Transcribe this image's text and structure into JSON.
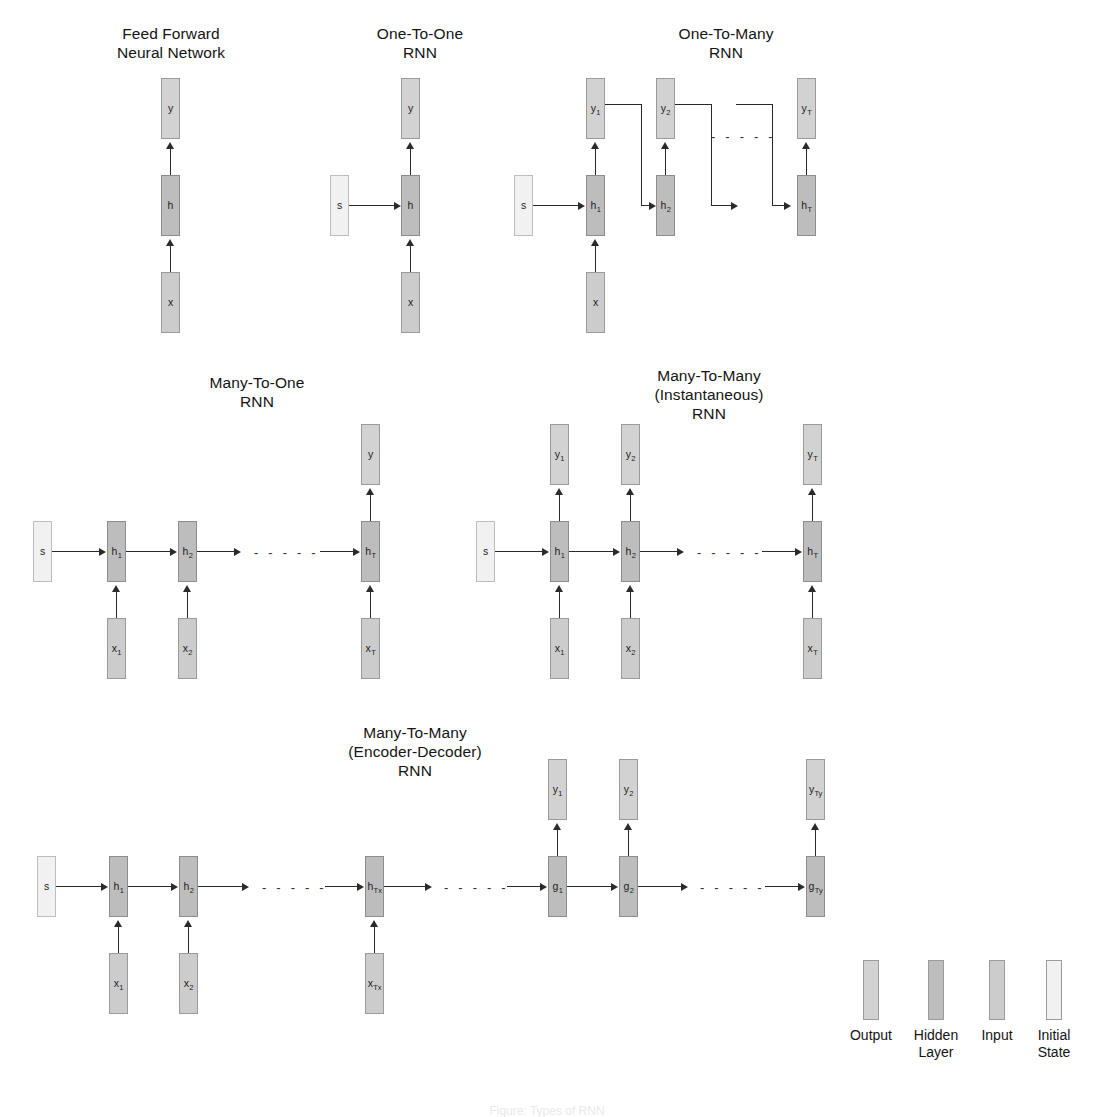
{
  "figure": {
    "caption": "Figure:  Types of RNN",
    "panels": [
      {
        "id": "feed-forward",
        "title": "Feed Forward\nNeural Network",
        "nodes": [
          {
            "role": "output",
            "label": "y"
          },
          {
            "role": "hidden",
            "label": "h"
          },
          {
            "role": "input",
            "label": "x"
          }
        ]
      },
      {
        "id": "one-to-one",
        "title": "One-To-One\nRNN",
        "nodes": [
          {
            "role": "state",
            "label": "s"
          },
          {
            "role": "output",
            "label": "y"
          },
          {
            "role": "hidden",
            "label": "h"
          },
          {
            "role": "input",
            "label": "x"
          }
        ]
      },
      {
        "id": "one-to-many",
        "title": "One-To-Many\nRNN",
        "nodes": [
          {
            "role": "state",
            "label": "s"
          },
          {
            "role": "input",
            "label": "x"
          },
          {
            "role": "hidden",
            "label": "h",
            "sub": "1"
          },
          {
            "role": "hidden",
            "label": "h",
            "sub": "2"
          },
          {
            "role": "hidden",
            "label": "h",
            "sub": "T"
          },
          {
            "role": "output",
            "label": "y",
            "sub": "1"
          },
          {
            "role": "output",
            "label": "y",
            "sub": "2"
          },
          {
            "role": "output",
            "label": "y",
            "sub": "T"
          }
        ]
      },
      {
        "id": "many-to-one",
        "title": "Many-To-One\nRNN",
        "nodes": [
          {
            "role": "state",
            "label": "s"
          },
          {
            "role": "hidden",
            "label": "h",
            "sub": "1"
          },
          {
            "role": "hidden",
            "label": "h",
            "sub": "2"
          },
          {
            "role": "hidden",
            "label": "h",
            "sub": "T"
          },
          {
            "role": "input",
            "label": "x",
            "sub": "1"
          },
          {
            "role": "input",
            "label": "x",
            "sub": "2"
          },
          {
            "role": "input",
            "label": "x",
            "sub": "T"
          },
          {
            "role": "output",
            "label": "y"
          }
        ]
      },
      {
        "id": "many-to-many-instantaneous",
        "title": "Many-To-Many\n(Instantaneous)\nRNN",
        "nodes": [
          {
            "role": "state",
            "label": "s"
          },
          {
            "role": "hidden",
            "label": "h",
            "sub": "1"
          },
          {
            "role": "hidden",
            "label": "h",
            "sub": "2"
          },
          {
            "role": "hidden",
            "label": "h",
            "sub": "T"
          },
          {
            "role": "input",
            "label": "x",
            "sub": "1"
          },
          {
            "role": "input",
            "label": "x",
            "sub": "2"
          },
          {
            "role": "input",
            "label": "x",
            "sub": "T"
          },
          {
            "role": "output",
            "label": "y",
            "sub": "1"
          },
          {
            "role": "output",
            "label": "y",
            "sub": "2"
          },
          {
            "role": "output",
            "label": "y",
            "sub": "T"
          }
        ]
      },
      {
        "id": "many-to-many-encoder-decoder",
        "title": "Many-To-Many\n(Encoder-Decoder)\nRNN",
        "nodes": [
          {
            "role": "state",
            "label": "s"
          },
          {
            "role": "hidden",
            "label": "h",
            "sub": "1"
          },
          {
            "role": "hidden",
            "label": "h",
            "sub": "2"
          },
          {
            "role": "hidden",
            "label": "h",
            "sub": "Tx"
          },
          {
            "role": "input",
            "label": "x",
            "sub": "1"
          },
          {
            "role": "input",
            "label": "x",
            "sub": "2"
          },
          {
            "role": "input",
            "label": "x",
            "sub": "Tx"
          },
          {
            "role": "hidden",
            "label": "g",
            "sub": "1"
          },
          {
            "role": "hidden",
            "label": "g",
            "sub": "2"
          },
          {
            "role": "hidden",
            "label": "g",
            "sub": "Ty"
          },
          {
            "role": "output",
            "label": "y",
            "sub": "1"
          },
          {
            "role": "output",
            "label": "y",
            "sub": "2"
          },
          {
            "role": "output",
            "label": "y",
            "sub": "Ty"
          }
        ]
      }
    ],
    "legend": {
      "items": [
        {
          "label": "Output",
          "role": "output",
          "color": "#d2d2d2"
        },
        {
          "label": "Hidden\nLayer",
          "role": "hidden",
          "color": "#bdbdbd"
        },
        {
          "label": "Input",
          "role": "input",
          "color": "#cccccc"
        },
        {
          "label": "Initial\nState",
          "role": "state",
          "color": "#f1f1f1"
        }
      ]
    },
    "labels": {
      "ff_y": "y",
      "ff_h": "h",
      "ff_x": "x",
      "o2o_s": "s",
      "o2o_y": "y",
      "o2o_h": "h",
      "o2o_x": "x",
      "o2m_s": "s",
      "o2m_x": "x",
      "m2o_s": "s",
      "m2o_y": "y",
      "m2m_s": "s",
      "enc_s": "s",
      "sub_1": "1",
      "sub_2": "2",
      "sub_T": "T",
      "sub_Tx": "Tx",
      "sub_Ty": "Ty",
      "h": "h",
      "y": "y",
      "x": "x",
      "g": "g",
      "ellipsis": "- - - - -"
    }
  }
}
